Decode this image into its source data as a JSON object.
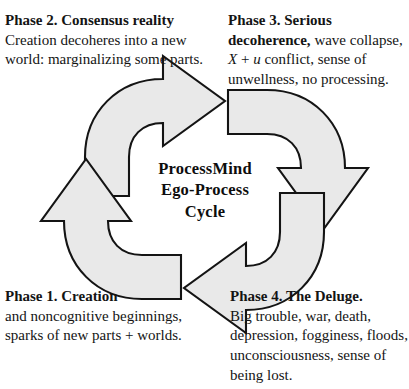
{
  "diagram": {
    "title": "ProcessMind Ego-Process Cycle",
    "center_label": {
      "line1": "ProcessMind",
      "line2": "Ego-Process",
      "line3": "Cycle"
    },
    "colors": {
      "arrow_fill": "#e9e9e9",
      "arrow_stroke": "#141414",
      "text": "#141414",
      "background": "#ffffff"
    },
    "cycle_direction": "clockwise",
    "arrows": [
      {
        "name": "arrow-top",
        "points": "right",
        "from_phase": "Phase 2. Consensus reality",
        "to_phase": "Phase 3. Serious decoherence"
      },
      {
        "name": "arrow-right",
        "points": "down",
        "from_phase": "Phase 3. Serious decoherence",
        "to_phase": "Phase 4. The Deluge."
      },
      {
        "name": "arrow-bottom",
        "points": "left",
        "from_phase": "Phase 4. The Deluge.",
        "to_phase": "Phase 1. Creation"
      },
      {
        "name": "arrow-left",
        "points": "up",
        "from_phase": "Phase 1. Creation",
        "to_phase": "Phase 2. Consensus reality"
      }
    ],
    "phases": [
      {
        "id": "phase-1",
        "position": "bottom-left",
        "heading": "Phase 1. Creation",
        "body": " and noncognitive beginnings, sparks of new parts + worlds."
      },
      {
        "id": "phase-2",
        "position": "top-left",
        "heading": "Phase 2. Consensus reality",
        "body": "Creation decoheres into a new world: marginalizing some parts."
      },
      {
        "id": "phase-3",
        "position": "top-right",
        "heading": "Phase 3. Serious decoherence,",
        "body_part1": " wave collapse,",
        "body_italic_x": "X",
        "body_plus": " + ",
        "body_italic_u": "u",
        "body_part2": " conflict, sense of unwellness, no processing."
      },
      {
        "id": "phase-4",
        "position": "bottom-right",
        "heading": "Phase 4. The Deluge.",
        "body": "Big trouble, war, death, depression, fogginess, floods, unconsciousness, sense of being lost."
      }
    ]
  }
}
